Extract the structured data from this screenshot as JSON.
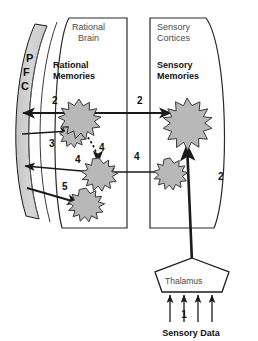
{
  "diagram": {
    "regions": [
      {
        "id": "rational_brain",
        "label_line1": "Rational",
        "label_line2": "Brain"
      },
      {
        "id": "sensory_cortices",
        "label_line1": "Sensory",
        "label_line2": "Cortices"
      }
    ],
    "group_labels": [
      {
        "id": "rational_memories",
        "line1": "Rational",
        "line2": "Memories"
      },
      {
        "id": "sensory_memories",
        "line1": "Sensory",
        "line2": "Memories"
      }
    ],
    "pfc": {
      "letters": [
        "P",
        "F",
        "C"
      ],
      "fill": "#d0d0d0",
      "stroke": "#1a1a1a"
    },
    "thalamus": {
      "label": "Thalamus",
      "fill": "#ffffff",
      "stroke": "#1a1a1a"
    },
    "sensory_data": {
      "label": "Sensory Data",
      "step": "1",
      "arrow_count": 4
    },
    "step_labels": [
      {
        "id": "step-2-rational-to-pfc",
        "text": "2",
        "x": 52,
        "y": 104
      },
      {
        "id": "step-2-rational-to-sensory",
        "text": "2",
        "x": 137,
        "y": 104
      },
      {
        "id": "step-3-small-to-pfc",
        "text": "3",
        "x": 49,
        "y": 147
      },
      {
        "id": "step-4-dotted",
        "text": "4",
        "x": 99,
        "y": 151
      },
      {
        "id": "step-4-mid-left",
        "text": "4",
        "x": 75,
        "y": 163
      },
      {
        "id": "step-4-mid-right",
        "text": "4",
        "x": 134,
        "y": 160
      },
      {
        "id": "step-5-pfc-to-star",
        "text": "5",
        "x": 62,
        "y": 190
      },
      {
        "id": "step-2-thalamus-to-sensory",
        "text": "2",
        "x": 218,
        "y": 180
      }
    ],
    "stars": [
      {
        "id": "rational-memory-large",
        "cx": 79,
        "cy": 117,
        "r": 18,
        "points": 12,
        "fill": "#b8b8b8"
      },
      {
        "id": "rational-memory-small-upper",
        "cx": 73,
        "cy": 133,
        "r": 11,
        "points": 11,
        "fill": "#b8b8b8"
      },
      {
        "id": "rational-memory-mid",
        "cx": 99,
        "cy": 172,
        "r": 13,
        "points": 12,
        "fill": "#b8b8b8"
      },
      {
        "id": "rational-memory-lower",
        "cx": 86,
        "cy": 202,
        "r": 13,
        "points": 12,
        "fill": "#b8b8b8"
      },
      {
        "id": "sensory-memory-large",
        "cx": 187,
        "cy": 120,
        "r": 22,
        "points": 13,
        "fill": "#b8b8b8"
      },
      {
        "id": "sensory-memory-small",
        "cx": 170,
        "cy": 170,
        "r": 12,
        "points": 12,
        "fill": "#b8b8b8"
      }
    ],
    "colors": {
      "line": "#1a1a1a",
      "star_fill": "#b8b8b8",
      "star_stroke": "#3a3a3a",
      "pfc_fill": "#d0d0d0",
      "region_stroke": "#2a2a2a",
      "background": "#ffffff"
    }
  }
}
